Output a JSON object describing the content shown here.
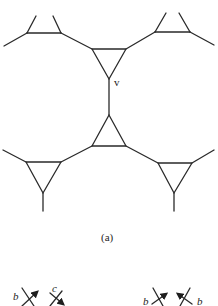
{
  "figure": {
    "caption": "(a)",
    "vertex_label": "v",
    "colors": {
      "line": "#2a2a2a",
      "background": "#ffffff"
    }
  },
  "graph": {
    "triangles": [
      {
        "id": "top-left",
        "points": [
          [
            27,
            33
          ],
          [
            61,
            33
          ]
        ],
        "note": "open top (two legs up)"
      },
      {
        "id": "top-center",
        "points": [
          [
            92,
            49
          ],
          [
            126,
            49
          ],
          [
            109,
            79
          ]
        ]
      },
      {
        "id": "top-right",
        "points": [
          [
            155,
            32
          ],
          [
            190,
            32
          ]
        ],
        "note": "open top (two legs up)"
      },
      {
        "id": "bottom-center",
        "points": [
          [
            109,
            115
          ],
          [
            92,
            146
          ],
          [
            126,
            146
          ]
        ]
      },
      {
        "id": "bottom-left",
        "points": [
          [
            26,
            162
          ],
          [
            61,
            162
          ],
          [
            43,
            193
          ]
        ]
      },
      {
        "id": "bottom-right",
        "points": [
          [
            158,
            163
          ],
          [
            192,
            163
          ],
          [
            174,
            193
          ]
        ]
      }
    ]
  },
  "bottom_fragment": {
    "left": {
      "labels": [
        "b",
        "c"
      ]
    },
    "right": {
      "labels": [
        "b",
        "b"
      ]
    }
  }
}
